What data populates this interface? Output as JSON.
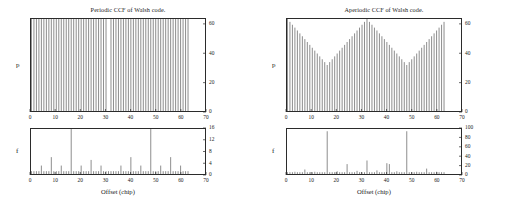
{
  "figure": {
    "width": 512,
    "height": 204,
    "background": "#ffffff",
    "ink": "#2b2b2b"
  },
  "panels": [
    {
      "id": "periodic",
      "title": "Periodic CCF of Walsh code.",
      "xlabel": "Offset (chip)",
      "subplots": [
        "p",
        "f"
      ]
    },
    {
      "id": "aperiodic",
      "title": "Aperiodic CCF of Walsh code.",
      "xlabel": "Offset (chip)",
      "subplots": [
        "p",
        "f"
      ]
    }
  ],
  "chart_data": [
    {
      "id": "periodic-p",
      "type": "bar",
      "title": "Periodic CCF of Walsh code.",
      "panel": "periodic",
      "subplot": "p",
      "xlabel": "Offset (chip)",
      "ylabel": "p",
      "xlim": [
        0,
        70
      ],
      "ylim": [
        0,
        64
      ],
      "xticks": [
        0,
        10,
        20,
        30,
        40,
        50,
        60,
        70
      ],
      "yticks": [
        0,
        20,
        40,
        60
      ],
      "grid": false,
      "legend": null,
      "x": [
        0,
        1,
        2,
        3,
        4,
        5,
        6,
        7,
        8,
        9,
        10,
        11,
        12,
        13,
        14,
        15,
        16,
        17,
        18,
        19,
        20,
        21,
        22,
        23,
        24,
        25,
        26,
        27,
        28,
        29,
        30,
        31,
        32,
        33,
        34,
        35,
        36,
        37,
        38,
        39,
        40,
        41,
        42,
        43,
        44,
        45,
        46,
        47,
        48,
        49,
        50,
        51,
        52,
        53,
        54,
        55,
        56,
        57,
        58,
        59,
        60,
        61,
        62,
        63,
        64,
        65,
        66,
        67,
        68,
        69,
        70
      ],
      "values": [
        64,
        64,
        64,
        64,
        64,
        64,
        64,
        64,
        64,
        64,
        64,
        64,
        64,
        64,
        64,
        64,
        64,
        64,
        64,
        64,
        64,
        64,
        64,
        64,
        64,
        64,
        64,
        64,
        64,
        64,
        64,
        0,
        64,
        64,
        64,
        64,
        64,
        64,
        64,
        64,
        64,
        64,
        64,
        64,
        64,
        64,
        64,
        64,
        64,
        64,
        64,
        64,
        64,
        64,
        64,
        64,
        64,
        64,
        64,
        64,
        64,
        64,
        64,
        64,
        0,
        0,
        0,
        0,
        0,
        0,
        0
      ]
    },
    {
      "id": "periodic-f",
      "type": "bar",
      "title": null,
      "panel": "periodic",
      "subplot": "f",
      "xlabel": "Offset (chip)",
      "ylabel": "f",
      "xlim": [
        0,
        70
      ],
      "ylim": [
        0,
        16
      ],
      "xticks": [
        0,
        10,
        20,
        30,
        40,
        50,
        60,
        70
      ],
      "yticks": [
        0,
        4,
        8,
        12,
        16
      ],
      "grid": false,
      "legend": null,
      "x": [
        0,
        1,
        2,
        3,
        4,
        5,
        6,
        7,
        8,
        9,
        10,
        11,
        12,
        13,
        14,
        15,
        16,
        17,
        18,
        19,
        20,
        21,
        22,
        23,
        24,
        25,
        26,
        27,
        28,
        29,
        30,
        31,
        32,
        33,
        34,
        35,
        36,
        37,
        38,
        39,
        40,
        41,
        42,
        43,
        44,
        45,
        46,
        47,
        48,
        49,
        50,
        51,
        52,
        53,
        54,
        55,
        56,
        57,
        58,
        59,
        60,
        61,
        62,
        63,
        64,
        65,
        66,
        67,
        68,
        69,
        70
      ],
      "values": [
        1,
        1,
        1,
        1,
        3,
        1,
        1,
        1,
        6,
        1,
        1,
        1,
        3,
        1,
        1,
        1,
        16,
        1,
        1,
        1,
        3,
        1,
        1,
        1,
        5,
        1,
        1,
        1,
        3,
        1,
        1,
        1,
        1,
        1,
        1,
        1,
        3,
        1,
        1,
        1,
        6,
        1,
        1,
        1,
        3,
        1,
        1,
        1,
        16,
        1,
        1,
        1,
        3,
        1,
        1,
        1,
        6,
        1,
        1,
        1,
        3,
        1,
        1,
        1,
        0,
        0,
        0,
        0,
        0,
        0,
        0
      ]
    },
    {
      "id": "aperiodic-p",
      "type": "bar",
      "title": "Aperiodic CCF of Walsh code.",
      "panel": "aperiodic",
      "subplot": "p",
      "xlabel": "Offset (chip)",
      "ylabel": "p",
      "xlim": [
        0,
        70
      ],
      "ylim": [
        0,
        64
      ],
      "xticks": [
        0,
        10,
        20,
        30,
        40,
        50,
        60,
        70
      ],
      "yticks": [
        0,
        20,
        40,
        60
      ],
      "grid": false,
      "legend": null,
      "x": [
        0,
        1,
        2,
        3,
        4,
        5,
        6,
        7,
        8,
        9,
        10,
        11,
        12,
        13,
        14,
        15,
        16,
        17,
        18,
        19,
        20,
        21,
        22,
        23,
        24,
        25,
        26,
        27,
        28,
        29,
        30,
        31,
        32,
        33,
        34,
        35,
        36,
        37,
        38,
        39,
        40,
        41,
        42,
        43,
        44,
        45,
        46,
        47,
        48,
        49,
        50,
        51,
        52,
        53,
        54,
        55,
        56,
        57,
        58,
        59,
        60,
        61,
        62,
        63,
        64,
        65,
        66,
        67,
        68,
        69,
        70
      ],
      "values": [
        64,
        62,
        60,
        58,
        56,
        54,
        52,
        50,
        48,
        46,
        44,
        42,
        40,
        38,
        36,
        34,
        32,
        34,
        36,
        38,
        40,
        42,
        44,
        46,
        48,
        50,
        52,
        54,
        56,
        58,
        60,
        62,
        64,
        62,
        60,
        58,
        56,
        54,
        52,
        50,
        48,
        46,
        44,
        42,
        40,
        38,
        36,
        34,
        32,
        34,
        36,
        38,
        40,
        42,
        44,
        46,
        48,
        50,
        52,
        54,
        56,
        58,
        60,
        62,
        0,
        0,
        0,
        0,
        0,
        0,
        0
      ]
    },
    {
      "id": "aperiodic-f",
      "type": "bar",
      "title": null,
      "panel": "aperiodic",
      "subplot": "f",
      "xlabel": "Offset (chip)",
      "ylabel": "f",
      "xlim": [
        0,
        70
      ],
      "ylim": [
        0,
        100
      ],
      "xticks": [
        0,
        10,
        20,
        30,
        40,
        50,
        60,
        70
      ],
      "yticks": [
        0,
        20,
        40,
        60,
        80,
        100
      ],
      "grid": false,
      "legend": null,
      "x": [
        0,
        1,
        2,
        3,
        4,
        5,
        6,
        7,
        8,
        9,
        10,
        11,
        12,
        13,
        14,
        15,
        16,
        17,
        18,
        19,
        20,
        21,
        22,
        23,
        24,
        25,
        26,
        27,
        28,
        29,
        30,
        31,
        32,
        33,
        34,
        35,
        36,
        37,
        38,
        39,
        40,
        41,
        42,
        43,
        44,
        45,
        46,
        47,
        48,
        49,
        50,
        51,
        52,
        53,
        54,
        55,
        56,
        57,
        58,
        59,
        60,
        61,
        62,
        63,
        64,
        65,
        66,
        67,
        68,
        69,
        70
      ],
      "values": [
        4,
        4,
        4,
        5,
        4,
        4,
        4,
        10,
        4,
        4,
        4,
        5,
        4,
        4,
        4,
        4,
        95,
        4,
        4,
        4,
        6,
        4,
        4,
        4,
        22,
        4,
        4,
        4,
        7,
        4,
        4,
        4,
        30,
        4,
        4,
        4,
        8,
        4,
        4,
        4,
        24,
        22,
        4,
        4,
        6,
        4,
        4,
        4,
        95,
        4,
        4,
        4,
        5,
        4,
        4,
        4,
        12,
        4,
        4,
        4,
        5,
        4,
        4,
        4,
        0,
        0,
        0,
        0,
        0,
        0,
        0
      ]
    }
  ]
}
